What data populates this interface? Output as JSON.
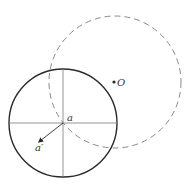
{
  "diagram": {
    "type": "geometry",
    "labels": {
      "center_point": "a",
      "arrow_point": "a′",
      "outer_point": "O"
    },
    "colors": {
      "solid_circle": "#2a2a2a",
      "dashed_circle": "#8a8a8a",
      "axes": "#7a7a7a",
      "arrow": "#2a2a2a",
      "background": "#ffffff"
    },
    "solid_circle": {
      "cx": 63,
      "cy": 123,
      "r": 54
    },
    "dashed_circle": {
      "cx": 115,
      "cy": 82,
      "r": 66
    },
    "point_O": {
      "x": 114,
      "y": 82
    },
    "arrow": {
      "from": [
        63,
        123
      ],
      "to": [
        38,
        143
      ]
    }
  }
}
